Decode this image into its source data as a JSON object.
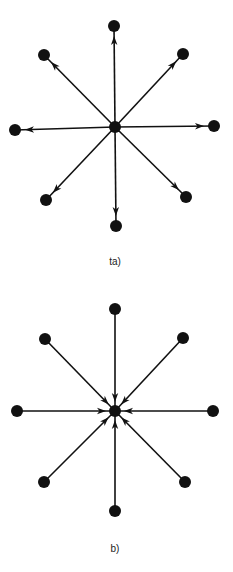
{
  "figure": {
    "panels": [
      {
        "id": "a",
        "label": "(a)",
        "label_display": "ta)",
        "label_pos": [
          115,
          262
        ],
        "direction": "outward",
        "center": [
          115,
          127
        ],
        "nodes": [
          [
            114,
            26
          ],
          [
            183,
            54
          ],
          [
            214,
            126
          ],
          [
            186,
            197
          ],
          [
            116,
            226
          ],
          [
            46,
            200
          ],
          [
            15,
            130
          ],
          [
            44,
            55
          ]
        ]
      },
      {
        "id": "b",
        "label": "(b)",
        "label_display": "b)",
        "label_pos": [
          115,
          549
        ],
        "direction": "inward",
        "center": [
          115,
          411
        ],
        "nodes": [
          [
            115,
            309
          ],
          [
            183,
            338
          ],
          [
            213,
            411
          ],
          [
            185,
            482
          ],
          [
            115,
            511
          ],
          [
            44,
            482
          ],
          [
            17,
            411
          ],
          [
            45,
            339
          ]
        ]
      }
    ],
    "style": {
      "node_color": "#111111",
      "edge_color": "#111111",
      "outer_node_radius": 6,
      "center_node_radius": 6
    },
    "caption_cropped": ""
  }
}
